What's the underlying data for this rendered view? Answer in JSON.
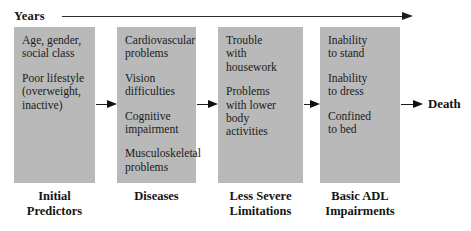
{
  "timeline": {
    "label": "Years",
    "arrow_icon": "right-arrow-icon"
  },
  "stages": [
    {
      "caption": "Initial\nPredictors",
      "items": [
        "Age, gender,\nsocial class",
        "Poor lifestyle\n(overweight,\ninactive)"
      ]
    },
    {
      "caption": "Diseases",
      "items": [
        "Cardiovascular\nproblems",
        "Vision\ndifficulties",
        "Cognitive\nimpairment",
        "Musculoskeletal\nproblems"
      ]
    },
    {
      "caption": "Less Severe\nLimitations",
      "items": [
        "Trouble\nwith\nhousework",
        "Problems\nwith lower\nbody\nactivities"
      ]
    },
    {
      "caption": "Basic ADL\nImpairments",
      "items": [
        "Inability\nto stand",
        "Inability\nto dress",
        "Confined\nto bed"
      ]
    }
  ],
  "terminal": {
    "label": "Death"
  },
  "colors": {
    "box_fill": "#b9b9b9",
    "text": "#1b1b1b",
    "arrow": "#111111",
    "background": "#ffffff"
  }
}
